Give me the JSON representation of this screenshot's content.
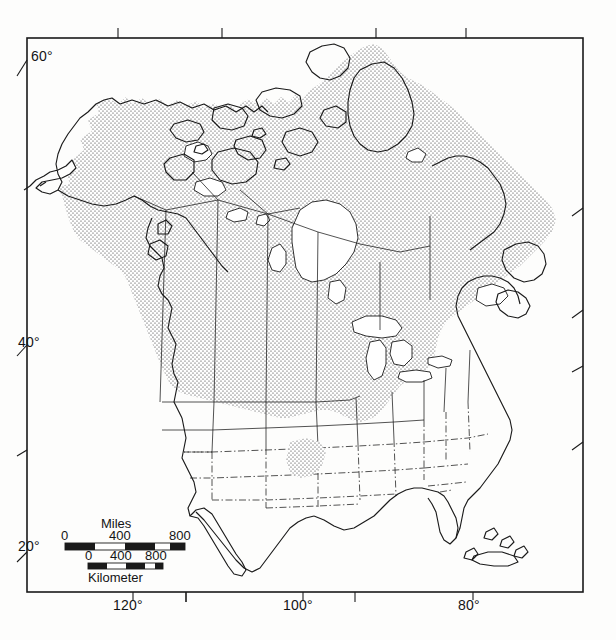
{
  "map": {
    "title": "North America distribution map",
    "projection_frame": {
      "x": 27,
      "y": 38,
      "width": 556,
      "height": 554
    },
    "background_color": "#fdfdfc",
    "line_color": "#1a1a1a",
    "stipple_color": "#2b2b2b",
    "latitude_labels": [
      {
        "text": "60°",
        "x": 31,
        "y": 50
      },
      {
        "text": "40°",
        "x": 18,
        "y": 336
      },
      {
        "text": "20°",
        "x": 18,
        "y": 538
      }
    ],
    "longitude_labels": [
      {
        "text": "120°",
        "x": 118,
        "y": 596
      },
      {
        "text": "100°",
        "x": 288,
        "y": 596
      },
      {
        "text": "80°",
        "x": 458,
        "y": 596
      }
    ],
    "latitude_ticks_left": [
      60,
      40,
      30,
      20
    ],
    "latitude_ticks_right": [
      50,
      40,
      35,
      28
    ],
    "longitude_ticks_top": [
      140,
      130,
      110,
      90
    ],
    "longitude_ticks_bottom": [
      130,
      110,
      90
    ],
    "legend_note": "Stippled shading indicates species range across Alaska, Canada and the northern and eastern United States"
  },
  "scale_bar": {
    "miles": {
      "unit_label": "Miles",
      "unit_label_position": "top",
      "ticks": [
        "0",
        "400",
        "800"
      ],
      "bar_x": 65,
      "bar_y": 543,
      "bar_width": 120,
      "bar_height": 7,
      "segments": 4
    },
    "kilometer": {
      "unit_label": "Kilometer",
      "unit_label_position": "bottom",
      "ticks": [
        "0",
        "400",
        "800"
      ],
      "bar_x": 88,
      "bar_y": 563,
      "bar_width": 75,
      "bar_height": 6,
      "segments": 4
    }
  }
}
